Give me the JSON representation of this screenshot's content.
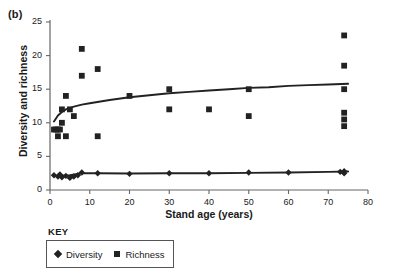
{
  "figure": {
    "panel_label": "(b)",
    "legend_title": "KEY"
  },
  "chart_data": {
    "type": "scatter",
    "title": "",
    "xlabel": "Stand age (years)",
    "ylabel": "Diversity and richness",
    "xlim": [
      0,
      80
    ],
    "ylim": [
      0,
      25
    ],
    "xticks": [
      0,
      10,
      20,
      30,
      40,
      50,
      60,
      70,
      80
    ],
    "xtick_labels": [
      "0",
      "10",
      "20",
      "30",
      "40",
      "50",
      "60",
      "70",
      "80"
    ],
    "yticks": [
      0,
      5,
      10,
      15,
      20,
      25
    ],
    "ytick_labels": [
      "0",
      "5",
      "10",
      "15",
      "20",
      "25"
    ],
    "grid": false,
    "legend_position": "below-left",
    "series": [
      {
        "name": "Richness",
        "marker": "square",
        "color": "#222222",
        "points": [
          [
            1,
            9
          ],
          [
            1.5,
            9
          ],
          [
            2,
            9
          ],
          [
            2.5,
            9
          ],
          [
            2,
            8
          ],
          [
            3,
            12
          ],
          [
            3,
            10
          ],
          [
            4,
            14
          ],
          [
            4,
            8
          ],
          [
            5,
            12
          ],
          [
            6,
            11
          ],
          [
            8,
            21
          ],
          [
            8,
            17
          ],
          [
            12,
            18
          ],
          [
            12,
            8
          ],
          [
            20,
            14
          ],
          [
            30,
            15
          ],
          [
            30,
            12
          ],
          [
            40,
            12
          ],
          [
            50,
            15
          ],
          [
            50,
            11
          ],
          [
            74,
            23
          ],
          [
            74,
            18.5
          ],
          [
            74,
            15
          ],
          [
            74,
            11.5
          ],
          [
            74,
            10.5
          ],
          [
            74,
            9.5
          ]
        ],
        "fit_curve": {
          "kind": "logarithmic",
          "points": [
            [
              1,
              10.2
            ],
            [
              2,
              11.1
            ],
            [
              3,
              11.6
            ],
            [
              4,
              12.0
            ],
            [
              6,
              12.4
            ],
            [
              8,
              12.7
            ],
            [
              10,
              12.9
            ],
            [
              15,
              13.4
            ],
            [
              20,
              13.8
            ],
            [
              25,
              14.1
            ],
            [
              30,
              14.4
            ],
            [
              35,
              14.6
            ],
            [
              40,
              14.8
            ],
            [
              45,
              15.0
            ],
            [
              50,
              15.2
            ],
            [
              55,
              15.3
            ],
            [
              60,
              15.5
            ],
            [
              65,
              15.6
            ],
            [
              70,
              15.7
            ],
            [
              75,
              15.8
            ]
          ]
        }
      },
      {
        "name": "Diversity",
        "marker": "diamond",
        "color": "#222222",
        "points": [
          [
            1,
            2.2
          ],
          [
            2,
            2.0
          ],
          [
            2.5,
            2.3
          ],
          [
            3,
            1.9
          ],
          [
            4,
            2.1
          ],
          [
            5,
            1.8
          ],
          [
            6,
            2.0
          ],
          [
            7,
            2.2
          ],
          [
            8,
            2.6
          ],
          [
            12,
            2.5
          ],
          [
            20,
            2.4
          ],
          [
            30,
            2.5
          ],
          [
            40,
            2.5
          ],
          [
            50,
            2.6
          ],
          [
            60,
            2.6
          ],
          [
            73,
            2.7
          ],
          [
            74,
            2.8
          ],
          [
            74,
            2.5
          ]
        ],
        "fit_curve": {
          "kind": "near-linear",
          "points": [
            [
              1,
              2.1
            ],
            [
              5,
              2.2
            ],
            [
              8,
              2.5
            ],
            [
              12,
              2.5
            ],
            [
              20,
              2.45
            ],
            [
              30,
              2.5
            ],
            [
              40,
              2.5
            ],
            [
              50,
              2.55
            ],
            [
              60,
              2.6
            ],
            [
              70,
              2.7
            ],
            [
              75,
              2.75
            ]
          ]
        }
      }
    ],
    "legend_entries": [
      {
        "label": "Diversity",
        "marker": "diamond"
      },
      {
        "label": "Richness",
        "marker": "square"
      }
    ]
  }
}
